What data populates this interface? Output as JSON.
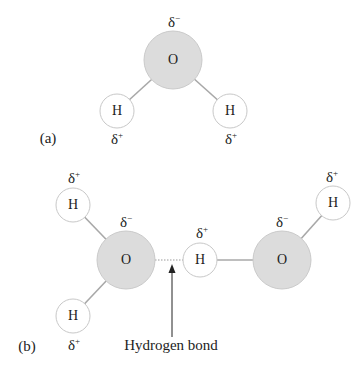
{
  "colors": {
    "oxygen_fill": "#dcdcdc",
    "oxygen_stroke": "#c8c8c8",
    "hydrogen_fill": "#ffffff",
    "hydrogen_stroke": "#c8c8c8",
    "bond": "#9a9a9a",
    "text": "#222222"
  },
  "panel_a": {
    "label": "(a)",
    "oxygen": {
      "symbol": "O",
      "charge": "δ",
      "charge_sign": "−"
    },
    "hydrogen_left": {
      "symbol": "H",
      "charge": "δ",
      "charge_sign": "+"
    },
    "hydrogen_right": {
      "symbol": "H",
      "charge": "δ",
      "charge_sign": "+"
    }
  },
  "panel_b": {
    "label": "(b)",
    "molecule_left": {
      "oxygen": {
        "symbol": "O",
        "charge": "δ",
        "charge_sign": "−"
      },
      "hydrogen_top": {
        "symbol": "H",
        "charge": "δ",
        "charge_sign": "+"
      },
      "hydrogen_bottom": {
        "symbol": "H",
        "charge": "δ",
        "charge_sign": "+"
      }
    },
    "molecule_right": {
      "oxygen": {
        "symbol": "O",
        "charge": "δ",
        "charge_sign": "−"
      },
      "hydrogen_bridging": {
        "symbol": "H",
        "charge": "δ",
        "charge_sign": "+"
      },
      "hydrogen_top": {
        "symbol": "H",
        "charge": "δ",
        "charge_sign": "+"
      }
    },
    "annotation": "Hydrogen bond"
  }
}
